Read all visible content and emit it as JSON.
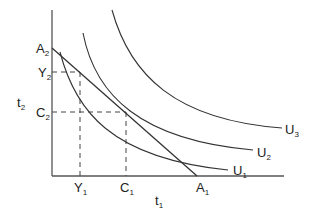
{
  "diagram": {
    "type": "indifference-curve-budget-constraint",
    "axes": {
      "x_label": {
        "base": "t",
        "sub": "1"
      },
      "y_label": {
        "base": "t",
        "sub": "2"
      }
    },
    "budget_line": {
      "y_intercept": {
        "base": "A",
        "sub": "2"
      },
      "x_intercept": {
        "base": "A",
        "sub": "1"
      }
    },
    "points": {
      "Y_x": {
        "base": "Y",
        "sub": "1"
      },
      "Y_y": {
        "base": "Y",
        "sub": "2"
      },
      "C_x": {
        "base": "C",
        "sub": "1"
      },
      "C_y": {
        "base": "C",
        "sub": "2"
      }
    },
    "curves": [
      {
        "base": "U",
        "sub": "1"
      },
      {
        "base": "U",
        "sub": "2"
      },
      {
        "base": "U",
        "sub": "3"
      }
    ],
    "colors": {
      "line": "#333333",
      "background": "#ffffff"
    }
  }
}
